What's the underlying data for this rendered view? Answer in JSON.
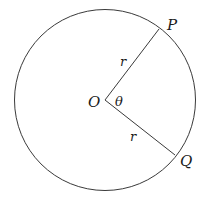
{
  "diagram": {
    "title": "",
    "colors": {
      "stroke": "#3a3a3a",
      "text": "#1a1a1a",
      "background": "#ffffff"
    },
    "circle": {
      "cx": 105,
      "cy": 100,
      "r": 90
    },
    "center": {
      "label": "O",
      "x": 105,
      "y": 100
    },
    "points": [
      {
        "label": "P",
        "x": 159,
        "y": 29
      },
      {
        "label": "Q",
        "x": 175,
        "y": 155
      }
    ],
    "radii": [
      {
        "from": "O",
        "to": "P",
        "label": "r"
      },
      {
        "from": "O",
        "to": "Q",
        "label": "r"
      }
    ],
    "angle": {
      "label": "θ",
      "vertex": "O",
      "between": [
        "P",
        "Q"
      ]
    }
  }
}
